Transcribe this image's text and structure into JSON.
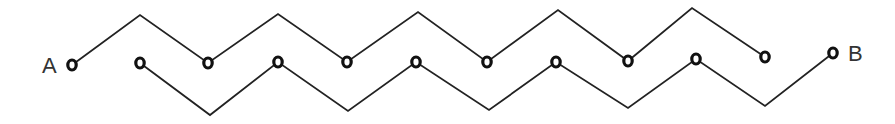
{
  "diagram": {
    "type": "zigzag-circuit",
    "labels": {
      "start": "A",
      "end": "B"
    },
    "colors": {
      "line": "#222222",
      "node": "#111111",
      "label": "#333333",
      "background": "#ffffff"
    },
    "upper_path": {
      "points": [
        [
          72,
          65
        ],
        [
          140,
          15
        ],
        [
          208,
          63
        ],
        [
          278,
          14
        ],
        [
          347,
          62
        ],
        [
          418,
          12
        ],
        [
          487,
          62
        ],
        [
          558,
          10
        ],
        [
          628,
          61
        ],
        [
          692,
          8
        ],
        [
          765,
          57
        ]
      ]
    },
    "lower_path": {
      "points": [
        [
          140,
          63
        ],
        [
          210,
          115
        ],
        [
          278,
          62
        ],
        [
          348,
          111
        ],
        [
          416,
          62
        ],
        [
          489,
          110
        ],
        [
          556,
          62
        ],
        [
          628,
          108
        ],
        [
          696,
          59
        ],
        [
          765,
          106
        ],
        [
          833,
          53
        ]
      ]
    },
    "nodes": [
      {
        "id": "A",
        "x": 72,
        "y": 65
      },
      {
        "id": "n1",
        "x": 140,
        "y": 63
      },
      {
        "id": "n2",
        "x": 208,
        "y": 63
      },
      {
        "id": "n3",
        "x": 278,
        "y": 62
      },
      {
        "id": "n4",
        "x": 347,
        "y": 62
      },
      {
        "id": "n5",
        "x": 416,
        "y": 62
      },
      {
        "id": "n6",
        "x": 487,
        "y": 62
      },
      {
        "id": "n7",
        "x": 556,
        "y": 62
      },
      {
        "id": "n8",
        "x": 628,
        "y": 61
      },
      {
        "id": "n9",
        "x": 696,
        "y": 59
      },
      {
        "id": "n10",
        "x": 765,
        "y": 57
      },
      {
        "id": "B",
        "x": 833,
        "y": 53
      }
    ]
  }
}
